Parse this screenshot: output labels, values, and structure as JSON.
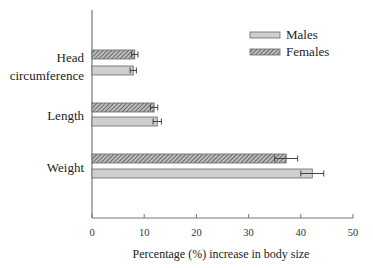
{
  "chart_data": {
    "type": "bar",
    "orientation": "horizontal",
    "title": "",
    "xlabel": "Percentage (%) increase in body size",
    "ylabel": "",
    "xlim": [
      0,
      50
    ],
    "xticks": [
      0,
      10,
      20,
      30,
      40,
      50
    ],
    "grid": false,
    "legend_position": "upper right",
    "categories": [
      "Head circumference",
      "Length",
      "Weight"
    ],
    "category_lines": [
      [
        "Head",
        "circumference"
      ],
      [
        "Length"
      ],
      [
        "Weight"
      ]
    ],
    "series": [
      {
        "name": "Females",
        "pattern": "hatched",
        "values": [
          8.2,
          11.9,
          37.2
        ],
        "errors": [
          0.6,
          0.7,
          2.2
        ]
      },
      {
        "name": "Males",
        "pattern": "solid",
        "values": [
          7.9,
          12.5,
          42.2
        ],
        "errors": [
          0.6,
          0.8,
          2.2
        ]
      }
    ]
  },
  "legend": {
    "items": [
      "Males",
      "Females"
    ]
  },
  "colors": {
    "males_fill": "#cfcfcf",
    "females_fill": "#bdbdbd",
    "hatch": "#555555",
    "border": "#666666",
    "axis": "#777777"
  }
}
